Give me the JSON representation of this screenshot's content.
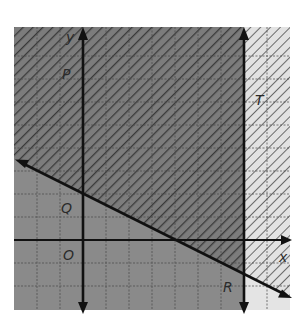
{
  "figure": {
    "labels": {
      "y_axis": "y",
      "x_axis": "x",
      "origin": "O",
      "P": "P",
      "Q": "Q",
      "R": "R",
      "T": "T"
    },
    "grid": {
      "cols": 12,
      "rows": 12,
      "spacing_px": 23
    },
    "lines": [
      {
        "name": "boundary-line",
        "equation": "y = -x/2 + 2",
        "style": "solid",
        "arrows": "both"
      },
      {
        "name": "vertical-line",
        "equation": "x = 7",
        "style": "solid",
        "arrows": "both"
      }
    ],
    "regions": [
      {
        "name": "hatched-region",
        "description": "above line y = -x/2 + 2",
        "pattern": "diagonal-hatch"
      },
      {
        "name": "dark-region",
        "description": "left of x = 7",
        "fill": "gray"
      }
    ],
    "colors": {
      "dark_fill": "#7a7a7a",
      "light_fill": "#dcdcdc",
      "hatch": "#3a3a3a",
      "grid": "#4a4a4a",
      "axis": "#111111"
    }
  }
}
